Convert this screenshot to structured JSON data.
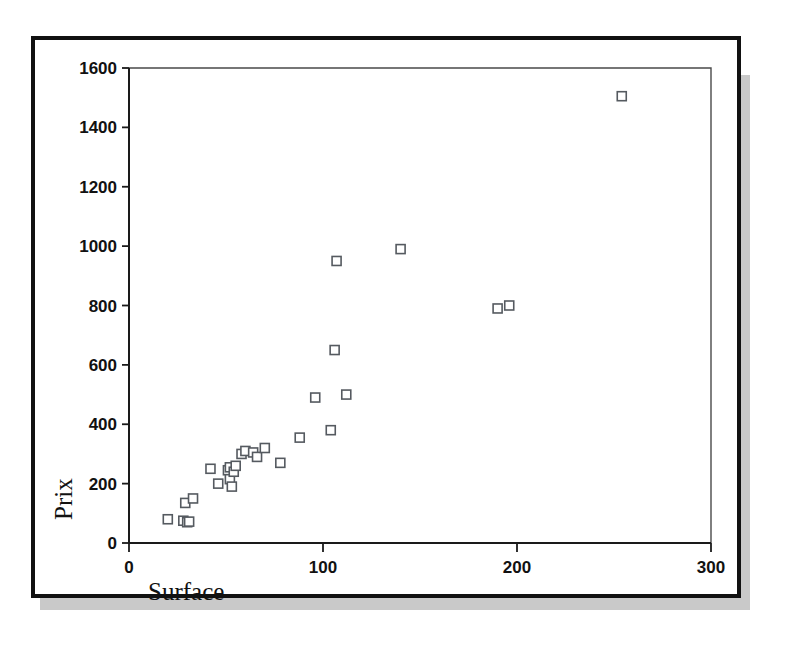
{
  "figure": {
    "frame_color": "#111111",
    "shadow_color": "#c9c9c9",
    "background": "#ffffff",
    "marker_stroke": "#555a60"
  },
  "chart_data": {
    "type": "scatter",
    "title": "",
    "xlabel": "Surface",
    "ylabel": "Prix",
    "xlim": [
      0,
      300
    ],
    "ylim": [
      0,
      1600
    ],
    "xticks": [
      0,
      100,
      200,
      300
    ],
    "yticks": [
      0,
      200,
      400,
      600,
      800,
      1000,
      1200,
      1400,
      1600
    ],
    "xtick_labels": [
      "0",
      "100",
      "200",
      "300"
    ],
    "ytick_labels": [
      "0",
      "200",
      "400",
      "600",
      "800",
      "1000",
      "1200",
      "1400",
      "1600"
    ],
    "grid": false,
    "legend": null,
    "marker": "open-square",
    "series": [
      {
        "name": "logements",
        "points": [
          [
            20,
            80
          ],
          [
            28,
            75
          ],
          [
            30,
            70
          ],
          [
            31,
            72
          ],
          [
            29,
            135
          ],
          [
            33,
            150
          ],
          [
            42,
            250
          ],
          [
            46,
            200
          ],
          [
            51,
            245
          ],
          [
            52,
            255
          ],
          [
            52,
            215
          ],
          [
            53,
            190
          ],
          [
            54,
            240
          ],
          [
            55,
            260
          ],
          [
            58,
            300
          ],
          [
            60,
            310
          ],
          [
            64,
            305
          ],
          [
            66,
            290
          ],
          [
            70,
            320
          ],
          [
            78,
            270
          ],
          [
            88,
            355
          ],
          [
            96,
            490
          ],
          [
            104,
            380
          ],
          [
            106,
            650
          ],
          [
            112,
            500
          ],
          [
            107,
            950
          ],
          [
            140,
            990
          ],
          [
            190,
            790
          ],
          [
            196,
            800
          ],
          [
            254,
            1505
          ]
        ]
      }
    ]
  },
  "axes": {
    "x_title": "Surface",
    "y_title": "Prix"
  }
}
